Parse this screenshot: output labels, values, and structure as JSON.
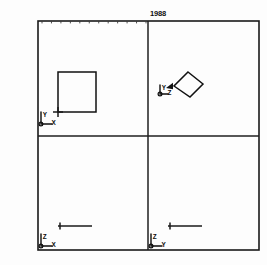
{
  "drawing": {
    "title": "1988",
    "title_position": {
      "x": 158,
      "y": 16
    },
    "frame": {
      "left": 38,
      "top": 21,
      "right": 259,
      "bottom": 250,
      "stroke_color": "#1a1a1a"
    },
    "dividers": {
      "vertical_x": 148,
      "horizontal_y": 136
    },
    "top_ruler": {
      "label": "top-edge-tick-scale",
      "tick_count": 12,
      "start_x": 42,
      "end_x": 146,
      "y": 21,
      "tick_length": 2.4
    },
    "quadrants": [
      {
        "id": "top-left",
        "name": "plan-view",
        "axis_triad": {
          "origin": {
            "x": 41,
            "y": 124
          },
          "vertical_label": "Y",
          "horizontal_label": "X",
          "vertical_length": 12,
          "horizontal_length": 11
        },
        "shape": {
          "type": "square",
          "name": "square-outline",
          "x": 58,
          "y": 72,
          "width": 38,
          "height": 40
        },
        "corner_marker": {
          "x": 58,
          "y": 112,
          "size": 5
        }
      },
      {
        "id": "top-right",
        "name": "isometric-view",
        "axis_triad": {
          "origin": {
            "x": 160,
            "y": 94
          },
          "vertical_label": "Y",
          "horizontal_label": "Z",
          "vertical_length": 9,
          "horizontal_length": 8
        },
        "shape": {
          "type": "parallelogram",
          "name": "parallelogram-outline",
          "points": "188,72 203,84 190,97 174,86"
        },
        "leader": {
          "from": {
            "x": 173,
            "y": 86
          },
          "to": {
            "x": 166,
            "y": 88
          }
        }
      },
      {
        "id": "bottom-left",
        "name": "front-elevation-view",
        "axis_triad": {
          "origin": {
            "x": 41,
            "y": 246
          },
          "vertical_label": "Z",
          "horizontal_label": "X",
          "vertical_length": 12,
          "horizontal_length": 11
        },
        "scale_bar": {
          "name": "scale-bar-left",
          "x1": 58,
          "x2": 92,
          "y": 226,
          "tick_x": 60,
          "tick_height": 7
        }
      },
      {
        "id": "bottom-right",
        "name": "side-elevation-view",
        "axis_triad": {
          "origin": {
            "x": 151,
            "y": 246
          },
          "vertical_label": "Z",
          "horizontal_label": "Y",
          "vertical_length": 12,
          "horizontal_length": 11
        },
        "scale_bar": {
          "name": "scale-bar-right",
          "x1": 168,
          "x2": 202,
          "y": 226,
          "tick_x": 170,
          "tick_height": 7
        }
      }
    ],
    "colors": {
      "ink": "#111111",
      "paper": "#fdfdfd",
      "tick": "#3a3a3a"
    }
  }
}
